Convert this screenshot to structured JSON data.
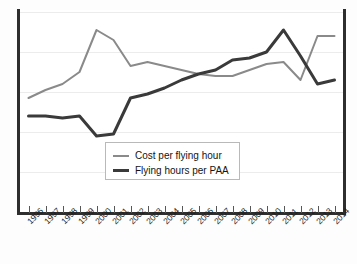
{
  "chart_data": {
    "type": "line",
    "title": "",
    "subtitle": "",
    "xlabel": "",
    "ylabel": "",
    "grid": true,
    "legend_position": "inside-bottom-center",
    "x_tick_rotation": -45,
    "y_axis_labels_shown": false,
    "ylim": [
      0,
      100
    ],
    "gridline_values": [
      100,
      80,
      60,
      40,
      20
    ],
    "categories": [
      "1996",
      "1997",
      "1998",
      "1999",
      "2000",
      "2001",
      "2002",
      "2003",
      "2004",
      "2005",
      "2006",
      "2007",
      "2008",
      "2009",
      "2010",
      "2011",
      "2012",
      "2013",
      "2014"
    ],
    "series": [
      {
        "name": "Cost per flying hour",
        "color": "#8a8a8a",
        "width": 2,
        "values": [
          57,
          61,
          64,
          70,
          91,
          86,
          73,
          75,
          73,
          71,
          69,
          68,
          68,
          71,
          74,
          75,
          66,
          88,
          88
        ]
      },
      {
        "name": "Flying hours per PAA",
        "color": "#3a3a3a",
        "width": 3,
        "values": [
          48,
          48,
          47,
          48,
          38,
          39,
          57,
          59,
          62,
          66,
          69,
          71,
          76,
          77,
          80,
          91,
          78,
          64,
          66
        ]
      }
    ]
  },
  "legend": {
    "items": [
      {
        "label": "Cost per flying hour",
        "swatch": "line-swatch-gray"
      },
      {
        "label": "Flying hours per PAA",
        "swatch": "line-swatch-dark"
      }
    ]
  },
  "axis": {
    "x_tick_labels": [
      "1996",
      "1997",
      "1998",
      "1999",
      "2000",
      "2001",
      "2002",
      "2003",
      "2004",
      "2005",
      "2006",
      "2007",
      "2008",
      "2009",
      "2010",
      "2011",
      "2012",
      "2013",
      "2014"
    ]
  },
  "colors": {
    "cost_line": "#8a8a8a",
    "hours_line": "#3a3a3a",
    "frame": "#2e2e2e",
    "gridline": "#ececed",
    "background": "#ffffff"
  }
}
